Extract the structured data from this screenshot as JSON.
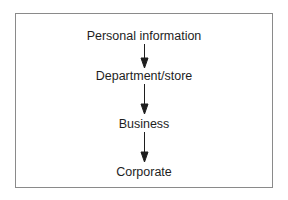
{
  "diagram": {
    "type": "flowchart",
    "direction": "top-to-bottom",
    "nodes": [
      {
        "id": "n1",
        "label": "Personal information"
      },
      {
        "id": "n2",
        "label": "Department/store"
      },
      {
        "id": "n3",
        "label": "Business"
      },
      {
        "id": "n4",
        "label": "Corporate"
      }
    ],
    "edges": [
      {
        "from": "n1",
        "to": "n2"
      },
      {
        "from": "n2",
        "to": "n3"
      },
      {
        "from": "n3",
        "to": "n4"
      }
    ],
    "colors": {
      "border": "#8a8a8a",
      "text": "#1e1e1e",
      "arrow": "#1e1e1e"
    }
  }
}
